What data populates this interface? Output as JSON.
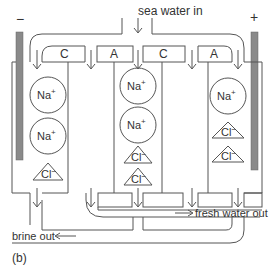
{
  "diagram": {
    "panel_label": "(b)",
    "inlet_label": "sea water in",
    "fresh_outlet_label": "fresh water out",
    "brine_outlet_label": "brine out",
    "electrodes": {
      "cathode_sign": "−",
      "anode_sign": "+",
      "color": "#8a8a8a"
    },
    "membranes": [
      {
        "label": "C"
      },
      {
        "label": "A"
      },
      {
        "label": "C"
      },
      {
        "label": "A"
      }
    ],
    "cells": [
      {
        "name": "left-compartment",
        "ions": [
          "Na+",
          "Na+",
          "Cl−"
        ]
      },
      {
        "name": "middle-compartment",
        "ions": [
          "Na+",
          "Na+",
          "Cl−",
          "Cl−"
        ]
      },
      {
        "name": "right-compartment",
        "ions": [
          "Na+",
          "Cl−",
          "Cl−"
        ]
      }
    ],
    "ion_text": {
      "na_base": "Na",
      "na_sup": "+",
      "cl_base": "Cl",
      "cl_sup": "−"
    },
    "line_color": "#555555"
  }
}
